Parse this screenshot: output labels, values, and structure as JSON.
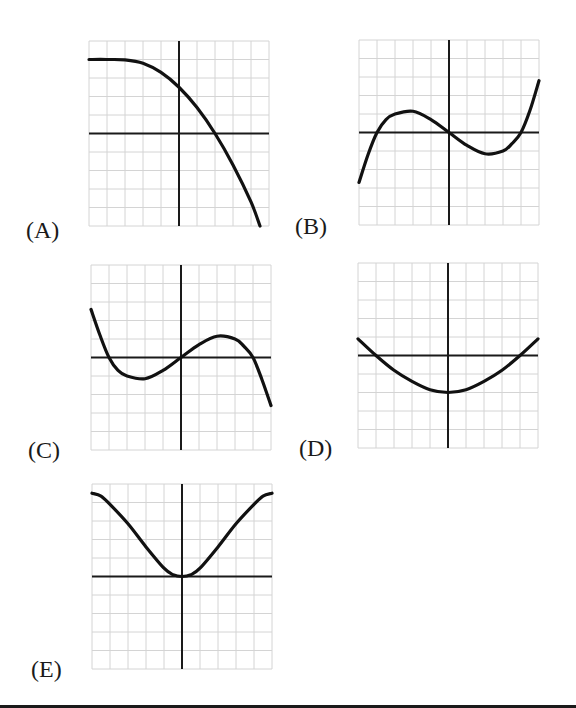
{
  "chart_data": [
    {
      "id": "A",
      "type": "line",
      "label": "(A)",
      "xlim": [
        -5,
        5
      ],
      "ylim": [
        -5,
        5
      ],
      "grid": true,
      "grid_step": 1,
      "description": "Decreasing curve, flat near y=4 on left, crosses y-axis at ~2.5, crosses x-axis at x=2, ends near (4.5,-5)",
      "points": [
        [
          -5,
          4
        ],
        [
          -4,
          4
        ],
        [
          -3,
          3.98
        ],
        [
          -2,
          3.8
        ],
        [
          -1,
          3.3
        ],
        [
          0,
          2.5
        ],
        [
          1,
          1.4
        ],
        [
          2,
          0
        ],
        [
          3,
          -1.7
        ],
        [
          4,
          -3.7
        ],
        [
          4.5,
          -5
        ]
      ]
    },
    {
      "id": "B",
      "type": "line",
      "label": "(B)",
      "xlim": [
        -5,
        5
      ],
      "ylim": [
        -5,
        5
      ],
      "grid": true,
      "grid_step": 1,
      "description": "Cubic with zeros at -4, 0, 4; local max near (-2,1.1); local min near (2,-1.1); increasing at both ends",
      "points": [
        [
          -5,
          -2.7
        ],
        [
          -4.5,
          -1.2
        ],
        [
          -4,
          0
        ],
        [
          -3.5,
          0.7
        ],
        [
          -3,
          1.0
        ],
        [
          -2,
          1.15
        ],
        [
          -1,
          0.7
        ],
        [
          0,
          0
        ],
        [
          1,
          -0.7
        ],
        [
          2,
          -1.15
        ],
        [
          3,
          -1.0
        ],
        [
          3.5,
          -0.6
        ],
        [
          4,
          0
        ],
        [
          4.5,
          1.2
        ],
        [
          5,
          2.8
        ]
      ]
    },
    {
      "id": "C",
      "type": "line",
      "label": "(C)",
      "xlim": [
        -5,
        5
      ],
      "ylim": [
        -5,
        5
      ],
      "grid": true,
      "grid_step": 1,
      "description": "Cubic with zeros at -4, 0, 4; local min near (-2,-1.1); local max near (2,1.1); decreasing at both ends",
      "points": [
        [
          -5,
          2.6
        ],
        [
          -4.5,
          1.2
        ],
        [
          -4,
          0
        ],
        [
          -3.5,
          -0.7
        ],
        [
          -3,
          -1.0
        ],
        [
          -2,
          -1.15
        ],
        [
          -1,
          -0.7
        ],
        [
          0,
          0
        ],
        [
          1,
          0.7
        ],
        [
          2,
          1.15
        ],
        [
          3,
          1.0
        ],
        [
          3.5,
          0.6
        ],
        [
          4,
          0
        ],
        [
          4.5,
          -1.2
        ],
        [
          5,
          -2.6
        ]
      ]
    },
    {
      "id": "D",
      "type": "line",
      "label": "(D)",
      "xlim": [
        -5,
        5
      ],
      "ylim": [
        -5,
        5
      ],
      "grid": true,
      "grid_step": 1,
      "description": "Upward U-shaped curve with vertex at (0,-2), zeros near x=-4 and x=4, ends near y=0.9",
      "points": [
        [
          -5,
          0.9
        ],
        [
          -4,
          0
        ],
        [
          -3,
          -0.8
        ],
        [
          -2,
          -1.4
        ],
        [
          -1,
          -1.85
        ],
        [
          0,
          -2
        ],
        [
          1,
          -1.85
        ],
        [
          2,
          -1.4
        ],
        [
          3,
          -0.8
        ],
        [
          4,
          0
        ],
        [
          5,
          0.9
        ]
      ]
    },
    {
      "id": "E",
      "type": "line",
      "label": "(E)",
      "xlim": [
        -5,
        5
      ],
      "ylim": [
        -5,
        5
      ],
      "grid": true,
      "grid_step": 1,
      "description": "Even function tangent to x-axis at origin, rising to about 4.5 at x=±5 with flattening at ends",
      "points": [
        [
          -5,
          4.5
        ],
        [
          -4.5,
          4.35
        ],
        [
          -4,
          3.9
        ],
        [
          -3,
          2.85
        ],
        [
          -2,
          1.6
        ],
        [
          -1,
          0.45
        ],
        [
          -0.5,
          0.1
        ],
        [
          0,
          0
        ],
        [
          0.5,
          0.1
        ],
        [
          1,
          0.45
        ],
        [
          2,
          1.6
        ],
        [
          3,
          2.85
        ],
        [
          4,
          3.9
        ],
        [
          4.5,
          4.35
        ],
        [
          5,
          4.5
        ]
      ]
    }
  ],
  "labels": {
    "A": "(A)",
    "B": "(B)",
    "C": "(C)",
    "D": "(D)",
    "E": "(E)"
  },
  "colors": {
    "curve": "#111111",
    "axis": "#1a1a1a",
    "grid": "#d4d4d4",
    "label": "#1a1a1a"
  }
}
